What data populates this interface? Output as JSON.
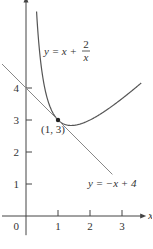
{
  "chart_data": {
    "type": "line",
    "title": "",
    "xlabel": "x",
    "ylabel": "y",
    "xlim": [
      -0.75,
      3.6
    ],
    "ylim": [
      -0.6,
      6.7
    ],
    "x_ticks": [
      1,
      2,
      3
    ],
    "x_tick_labels": [
      "1",
      "2",
      "3"
    ],
    "y_ticks": [
      1,
      2,
      3,
      4
    ],
    "y_tick_labels": [
      "1",
      "2",
      "3",
      "4"
    ],
    "origin_label": "0",
    "grid": false,
    "series": [
      {
        "name": "curve",
        "equation": "y = x + 2/x",
        "label_main": "y = x + ",
        "label_num": "2",
        "label_den": "x",
        "x_range": [
          0.33,
          3.6
        ],
        "color": "#555555"
      },
      {
        "name": "tangent",
        "equation": "y = -x + 4",
        "label": "y = −x + 4",
        "x_range": [
          -0.75,
          2.7
        ],
        "color": "#888888"
      }
    ],
    "annotations": [
      {
        "text": "(1, 3)",
        "x": 1,
        "y": 3,
        "point": true
      }
    ]
  }
}
